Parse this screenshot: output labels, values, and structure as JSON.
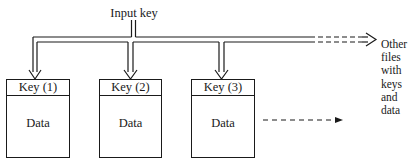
{
  "diagram": {
    "input_label": "Input key",
    "files": [
      {
        "key": "Key (1)",
        "data": "Data"
      },
      {
        "key": "Key (2)",
        "data": "Data"
      },
      {
        "key": "Key (3)",
        "data": "Data"
      }
    ],
    "other_files_label": [
      "Other",
      "files",
      "with",
      "keys",
      "and",
      "data"
    ],
    "colors": {
      "line": "#1a1a1a",
      "background": "#ffffff"
    }
  }
}
